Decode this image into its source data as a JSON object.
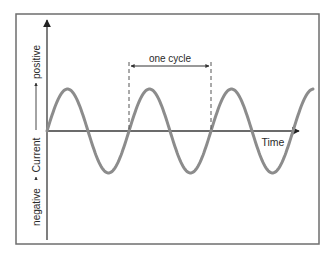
{
  "diagram": {
    "type": "alternating-current-sine-wave",
    "y_axis": {
      "label": "Current",
      "positive_label": "positive",
      "negative_label": "negative"
    },
    "x_axis": {
      "label": "Time"
    },
    "annotation": {
      "label": "one cycle"
    },
    "colors": {
      "wave": "#8c8c8c",
      "axes": "#3a3a3a",
      "frame": "#6e6e6e",
      "text": "#2a2a2a"
    },
    "wave": {
      "cycles_shown": 3.25,
      "start_phase": "zero-rising"
    }
  }
}
